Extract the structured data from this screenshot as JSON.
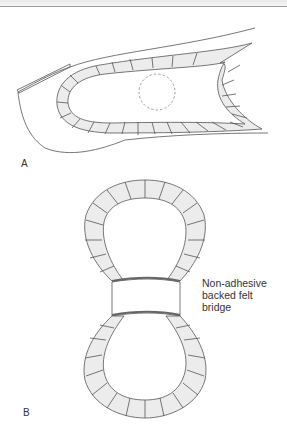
{
  "figure": {
    "panels": [
      {
        "id": "A",
        "label": "A",
        "description": "Toe with U-shaped crescent pad around lesion (dashed circle)"
      },
      {
        "id": "B",
        "label": "B",
        "description": "Figure-of-eight double ring pad with bridge"
      }
    ],
    "callout": {
      "lines": [
        "Non-adhesive",
        "backed felt",
        "bridge"
      ]
    },
    "colors": {
      "pad_fill": "#ececec",
      "outline": "#555555",
      "bridge_band": "#666666",
      "dashed_lesion": "#888888"
    }
  }
}
